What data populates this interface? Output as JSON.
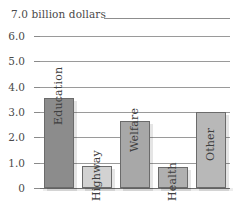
{
  "caption": {
    "top_label": "7.0 billion dollars"
  },
  "chart_data": {
    "type": "bar",
    "title": "",
    "subtitle": "",
    "xlabel": "",
    "ylabel": "7.0 billion dollars",
    "categories": [
      "Education",
      "Highway",
      "Welfare",
      "Health",
      "Other"
    ],
    "values": [
      3.55,
      0.88,
      2.63,
      0.83,
      3.0
    ],
    "series": [
      {
        "name": "Spending",
        "values": [
          3.55,
          0.88,
          2.63,
          0.83,
          3.0
        ]
      }
    ],
    "ylim": [
      0,
      6.0
    ],
    "ytick_labels": [
      "6.0",
      "5.0",
      "4.0",
      "3.0",
      "2.0",
      "1.0",
      "0"
    ],
    "ytick_values": [
      6.0,
      5.0,
      4.0,
      3.0,
      2.0,
      1.0,
      0
    ],
    "grid": true,
    "legend": "none",
    "bar_colors": [
      "#8c8c8c",
      "#d2d2d2",
      "#a8a8a8",
      "#b0b0b0",
      "#b8b8b8"
    ],
    "units": "billion dollars"
  },
  "colors": {
    "grid": "#9a9a9a",
    "axis": "#6e6e6e",
    "text": "#3f3f3f",
    "bar_dark": "#8c8c8c",
    "bar_light": "#d2d2d2"
  }
}
